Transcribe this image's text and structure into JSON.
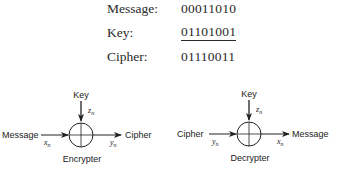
{
  "table": {
    "rows": [
      {
        "label": "Message:",
        "value": "00011010",
        "underlined": false
      },
      {
        "label": "Key:",
        "value": "01101001",
        "underlined": true
      },
      {
        "label": "Cipher:",
        "value": "01110011",
        "underlined": false
      }
    ]
  },
  "diagrams": {
    "encrypter": {
      "title": "Encrypter",
      "input_label": "Message",
      "input_var": "x",
      "input_sub": "n",
      "key_label": "Key",
      "key_var": "z",
      "key_sub": "n",
      "output_label": "Cipher",
      "output_var": "y",
      "output_sub": "n"
    },
    "decrypter": {
      "title": "Decrypter",
      "input_label": "Cipher",
      "input_var": "y",
      "input_sub": "n",
      "key_label": "Key",
      "key_var": "z",
      "key_sub": "n",
      "output_label": "Message",
      "output_var": "x",
      "output_sub": "n"
    }
  },
  "colors": {
    "ink": "#222222",
    "background": "#ffffff"
  }
}
